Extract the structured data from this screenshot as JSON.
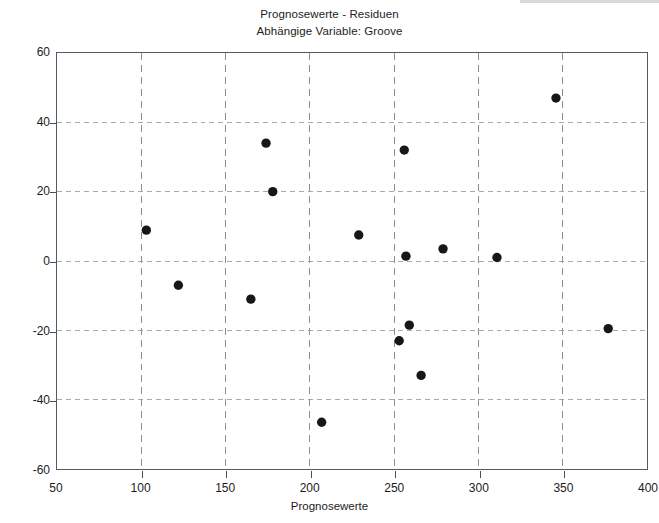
{
  "figure": {
    "title_line1": "Prognosewerte - Residuen",
    "title_line2": "Abhängige Variable: Groove"
  },
  "chart_data": {
    "type": "scatter",
    "title": "Prognosewerte - Residuen",
    "subtitle": "Abhängige Variable: Groove",
    "xlabel": "Prognosewerte",
    "ylabel": "Residuen",
    "xlim": [
      50,
      400
    ],
    "ylim": [
      -60,
      60
    ],
    "xticks": [
      50,
      100,
      150,
      200,
      250,
      300,
      350,
      400
    ],
    "xtick_labels": [
      "50",
      "100",
      "150",
      "200",
      "250",
      "300",
      "350",
      "400"
    ],
    "yticks": [
      -60,
      -40,
      -20,
      0,
      20,
      40,
      60
    ],
    "ytick_labels": [
      "-60",
      "-40",
      "-20",
      "0",
      "20",
      "40",
      "60"
    ],
    "grid": true,
    "grid_style": "dashed",
    "legend": false,
    "marker": "filled-circle",
    "marker_color": "#171717",
    "marker_size": 7,
    "points": [
      {
        "x": 103,
        "y": 8.9
      },
      {
        "x": 122,
        "y": -7.0
      },
      {
        "x": 165,
        "y": -11.0
      },
      {
        "x": 174,
        "y": 34.0
      },
      {
        "x": 178,
        "y": 20.0
      },
      {
        "x": 207,
        "y": -46.5
      },
      {
        "x": 229,
        "y": 7.5
      },
      {
        "x": 253,
        "y": -23.0
      },
      {
        "x": 256,
        "y": 32.0
      },
      {
        "x": 257,
        "y": 1.4
      },
      {
        "x": 259,
        "y": -18.5
      },
      {
        "x": 266,
        "y": -33.0
      },
      {
        "x": 279,
        "y": 3.5
      },
      {
        "x": 311,
        "y": 1.0
      },
      {
        "x": 346,
        "y": 47.0
      },
      {
        "x": 377,
        "y": -19.5
      }
    ]
  }
}
